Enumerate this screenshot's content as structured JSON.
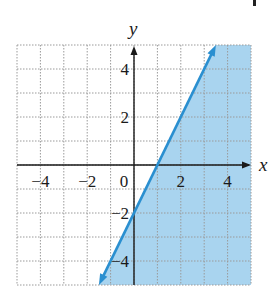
{
  "chart_data": {
    "type": "area",
    "title": "",
    "xlabel": "x",
    "ylabel": "y",
    "xlim": [
      -5,
      5
    ],
    "ylim": [
      -5,
      5
    ],
    "grid": true,
    "grid_style": "dotted",
    "grid_step": 1,
    "x_ticks": [
      {
        "value": -4,
        "label": "−4"
      },
      {
        "value": -2,
        "label": "−2"
      },
      {
        "value": 0,
        "label": "0"
      },
      {
        "value": 2,
        "label": "2"
      },
      {
        "value": 4,
        "label": "4"
      }
    ],
    "y_ticks": [
      {
        "value": 4,
        "label": "4"
      },
      {
        "value": 2,
        "label": "2"
      },
      {
        "value": -2,
        "label": "−2"
      },
      {
        "value": -4,
        "label": "−4"
      }
    ],
    "series": [
      {
        "name": "boundary line",
        "equation": "y = 2x - 2",
        "slope": 2,
        "intercept": -2,
        "style": "solid",
        "arrows": "both",
        "points": [
          [
            -1.5,
            -5
          ],
          [
            0,
            -2
          ],
          [
            1,
            0
          ],
          [
            2,
            2
          ],
          [
            3.5,
            5
          ]
        ]
      }
    ],
    "shaded_region": {
      "inequality": "y ≤ 2x − 2",
      "side": "right/below line",
      "polygon": [
        [
          -1.5,
          -5
        ],
        [
          3.5,
          5
        ],
        [
          5,
          5
        ],
        [
          5,
          -5
        ]
      ]
    },
    "colors": {
      "line": "#2a8fd0",
      "shade": "#a9d4ef",
      "grid": "#9a9a9a",
      "axis": "#1a1a1a"
    },
    "legend": null
  }
}
